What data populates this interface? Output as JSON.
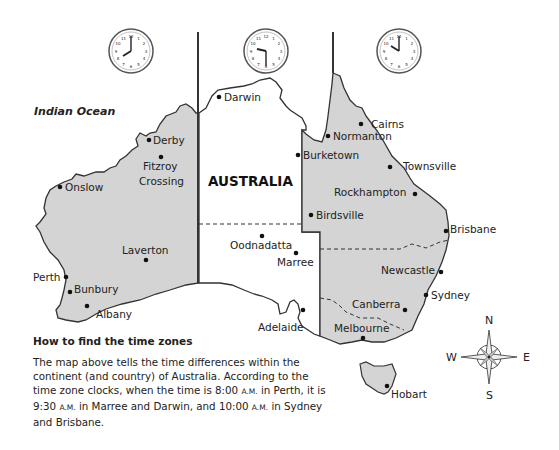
{
  "map": {
    "ocean_label": "Indian Ocean",
    "country_label": "AUSTRALIA",
    "zone_colors": {
      "shaded": "#d4d4d4",
      "unshaded": "#ffffff",
      "border": "#333333"
    },
    "clocks": [
      {
        "zone": "west",
        "time": "8:00",
        "hour": 8,
        "minute": 0
      },
      {
        "zone": "central",
        "time": "9:30",
        "hour": 9,
        "minute": 30
      },
      {
        "zone": "east",
        "time": "10:00",
        "hour": 10,
        "minute": 0
      }
    ],
    "cities": [
      {
        "name": "Darwin"
      },
      {
        "name": "Derby"
      },
      {
        "name": "Fitzroy"
      },
      {
        "name": "Crossing"
      },
      {
        "name": "Onslow"
      },
      {
        "name": "Laverton"
      },
      {
        "name": "Perth"
      },
      {
        "name": "Bunbury"
      },
      {
        "name": "Albany"
      },
      {
        "name": "Oodnadatta"
      },
      {
        "name": "Marree"
      },
      {
        "name": "Adelaide"
      },
      {
        "name": "Cairns"
      },
      {
        "name": "Normanton"
      },
      {
        "name": "Burketown"
      },
      {
        "name": "Townsville"
      },
      {
        "name": "Rockhampton"
      },
      {
        "name": "Birdsville"
      },
      {
        "name": "Brisbane"
      },
      {
        "name": "Newcastle"
      },
      {
        "name": "Sydney"
      },
      {
        "name": "Canberra"
      },
      {
        "name": "Melbourne"
      },
      {
        "name": "Hobart"
      }
    ],
    "compass": {
      "n": "N",
      "s": "S",
      "e": "E",
      "w": "W"
    }
  },
  "caption": {
    "title": "How to find the time zones",
    "t1": "The map above tells the time differences within the continent (and country) of Australia. According to the time zone clocks, when the time is 8:00 ",
    "am": "A.M.",
    "t2": " in Perth, it is 9:30 ",
    "t3": " in Marree and Darwin, and 10:00 ",
    "t4": " in Sydney and Brisbane."
  }
}
